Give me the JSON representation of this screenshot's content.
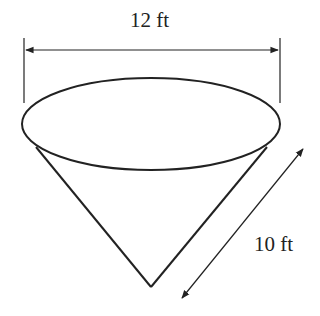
{
  "figure": {
    "type": "cone-diagram",
    "dimensions": {
      "diameter": {
        "label": "12 ft",
        "value": 12,
        "unit": "ft"
      },
      "slant_height": {
        "label": "10 ft",
        "value": 10,
        "unit": "ft"
      }
    },
    "colors": {
      "stroke": "#222222",
      "background": "#ffffff"
    }
  }
}
